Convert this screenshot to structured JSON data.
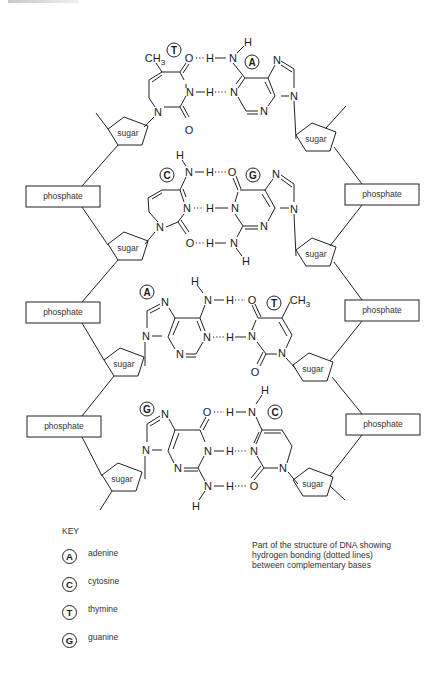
{
  "figure": {
    "caption_lines": [
      "Part of the structure of DNA showing",
      "hydrogen bonding (dotted lines)",
      "between complementary bases"
    ]
  },
  "backbone": {
    "sugar_label": "sugar",
    "phosphate_label": "phosphate",
    "left_strand": {
      "sugars": 4,
      "phosphates": 3
    },
    "right_strand": {
      "sugars": 4,
      "phosphates": 3
    }
  },
  "base_pairs": [
    {
      "left": "T",
      "right": "A",
      "hydrogen_bonds": 2
    },
    {
      "left": "C",
      "right": "G",
      "hydrogen_bonds": 3
    },
    {
      "left": "A",
      "right": "T",
      "hydrogen_bonds": 2
    },
    {
      "left": "G",
      "right": "C",
      "hydrogen_bonds": 3
    }
  ],
  "atoms": {
    "methyl": "CH",
    "methyl_sub": "3",
    "nitrogen": "N",
    "oxygen": "O",
    "hydrogen": "H"
  },
  "key": {
    "title": "KEY",
    "items": [
      {
        "symbol": "A",
        "name": "adenine"
      },
      {
        "symbol": "C",
        "name": "cytosine"
      },
      {
        "symbol": "T",
        "name": "thymine"
      },
      {
        "symbol": "G",
        "name": "guanine"
      }
    ]
  }
}
